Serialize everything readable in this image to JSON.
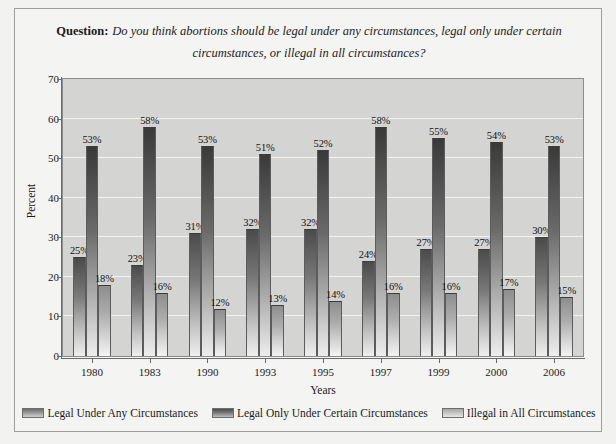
{
  "figure": {
    "question_label": "Question:",
    "question_text": "Do you think abortions should be legal under any circumstances, legal only under certain circumstances, or illegal in all circumstances?"
  },
  "legend": {
    "items": [
      {
        "label": "Legal Under Any Circumstances",
        "color": "#9b9b9b"
      },
      {
        "label": "Legal Only Under Certain Circumstances",
        "color": "#5a5a5a"
      },
      {
        "label": "Illegal in All Circumstances",
        "color": "#c6c6c6"
      }
    ]
  },
  "chart_data": {
    "type": "bar",
    "title": "Do you think abortions should be legal under any circumstances, legal only under certain circumstances, or illegal in all circumstances?",
    "xlabel": "Years",
    "ylabel": "Percent",
    "ylim": [
      0,
      70
    ],
    "yticks": [
      0,
      10,
      20,
      30,
      40,
      50,
      60,
      70
    ],
    "grid": true,
    "legend_position": "bottom",
    "categories": [
      "1980",
      "1983",
      "1990",
      "1993",
      "1995",
      "1997",
      "1999",
      "2000",
      "2006"
    ],
    "series": [
      {
        "name": "Legal Under Any Circumstances",
        "values": [
          25,
          23,
          31,
          32,
          32,
          24,
          27,
          27,
          30
        ],
        "labels": [
          "25%",
          "23%",
          "31%",
          "32%",
          "32%",
          "24%",
          "27%",
          "27%",
          "30%"
        ]
      },
      {
        "name": "Legal Only Under Certain Circumstances",
        "values": [
          53,
          58,
          53,
          51,
          52,
          58,
          55,
          54,
          53
        ],
        "labels": [
          "53%",
          "58%",
          "53%",
          "51%",
          "52%",
          "58%",
          "55%",
          "54%",
          "53%"
        ]
      },
      {
        "name": "Illegal in All Circumstances",
        "values": [
          18,
          16,
          12,
          13,
          14,
          16,
          16,
          17,
          15
        ],
        "labels": [
          "18%",
          "16%",
          "12%",
          "13%",
          "14%",
          "16%",
          "16%",
          "17%",
          "15%"
        ]
      }
    ]
  }
}
